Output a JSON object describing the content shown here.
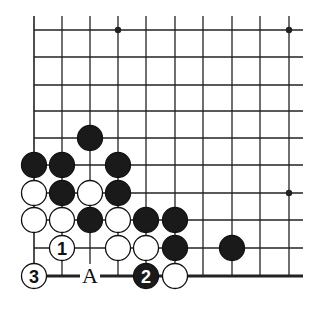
{
  "diagram": {
    "type": "go-board-fragment",
    "columns": 10,
    "rows": 10,
    "grid_x": [
      34,
      62,
      90,
      118,
      146,
      175,
      203,
      232,
      260,
      289
    ],
    "grid_y": [
      30,
      57,
      85,
      111,
      138,
      165,
      193,
      220,
      248,
      276
    ],
    "edges": {
      "bottom": true,
      "left": false,
      "top": false,
      "right": false
    },
    "star_points": [
      {
        "col": 3,
        "row": 0
      },
      {
        "col": 9,
        "row": 0
      },
      {
        "col": 9,
        "row": 6
      }
    ],
    "stones": [
      {
        "color": "black",
        "col": 2,
        "row": 4
      },
      {
        "color": "black",
        "col": 0,
        "row": 5
      },
      {
        "color": "black",
        "col": 1,
        "row": 5
      },
      {
        "color": "black",
        "col": 3,
        "row": 5
      },
      {
        "color": "white",
        "col": 0,
        "row": 6
      },
      {
        "color": "black",
        "col": 1,
        "row": 6
      },
      {
        "color": "white",
        "col": 2,
        "row": 6
      },
      {
        "color": "black",
        "col": 3,
        "row": 6
      },
      {
        "color": "white",
        "col": 0,
        "row": 7
      },
      {
        "color": "white",
        "col": 1,
        "row": 7
      },
      {
        "color": "black",
        "col": 2,
        "row": 7
      },
      {
        "color": "white",
        "col": 3,
        "row": 7
      },
      {
        "color": "black",
        "col": 4,
        "row": 7
      },
      {
        "color": "black",
        "col": 5,
        "row": 7
      },
      {
        "color": "white",
        "col": 1,
        "row": 8,
        "label": "1"
      },
      {
        "color": "white",
        "col": 3,
        "row": 8
      },
      {
        "color": "white",
        "col": 4,
        "row": 8
      },
      {
        "color": "black",
        "col": 5,
        "row": 8
      },
      {
        "color": "black",
        "col": 7,
        "row": 8
      },
      {
        "color": "white",
        "col": 0,
        "row": 9,
        "label": "3"
      },
      {
        "color": "black",
        "col": 4,
        "row": 9,
        "label": "2"
      },
      {
        "color": "white",
        "col": 5,
        "row": 9
      }
    ],
    "point_labels": [
      {
        "text": "A",
        "col": 2,
        "row": 9
      }
    ],
    "colors": {
      "line": "#222222",
      "black_stone": "#1a1a1a",
      "white_stone": "#ffffff",
      "background": "#ffffff"
    }
  }
}
